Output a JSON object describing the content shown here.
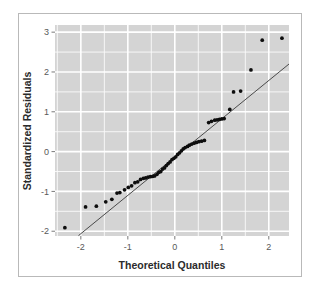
{
  "figure": {
    "kind": "qq-plot",
    "background_color": "#ffffff",
    "border_color": "#b9b9b9",
    "panel_color": "#d4d4d4",
    "gridline_color": "#ffffff",
    "point_color": "#0d0d0d",
    "line_color": "#4a4a4a"
  },
  "chart_data": {
    "type": "scatter",
    "title": "",
    "subtitle": "",
    "xlabel": "Theoretical Quantiles",
    "ylabel": "Standardized Residuals",
    "xlim": [
      -2.55,
      2.43
    ],
    "ylim": [
      -2.12,
      3.18
    ],
    "xticks": [
      -2,
      -1,
      0,
      1,
      2
    ],
    "xticklabels": [
      "-2",
      "-1",
      "0",
      "1",
      "2"
    ],
    "yticks": [
      3,
      2,
      1,
      0,
      -1,
      -2
    ],
    "yticklabels": [
      "3",
      "2",
      "1",
      "0",
      "-1",
      "-2"
    ],
    "grid": true,
    "grid_orientation": "both",
    "legend": null,
    "legend_position": "none",
    "annotations": [],
    "series": [
      {
        "name": "Standardized residuals vs theoretical quantiles",
        "marker": "filled-circle",
        "marker_size": 3.0,
        "points": [
          [
            -2.34,
            -1.91
          ],
          [
            -1.9,
            -1.39
          ],
          [
            -1.67,
            -1.37
          ],
          [
            -1.47,
            -1.26
          ],
          [
            -1.34,
            -1.2
          ],
          [
            -1.23,
            -1.04
          ],
          [
            -1.17,
            -1.03
          ],
          [
            -1.07,
            -0.96
          ],
          [
            -0.99,
            -0.9
          ],
          [
            -0.92,
            -0.86
          ],
          [
            -0.85,
            -0.78
          ],
          [
            -0.79,
            -0.76
          ],
          [
            -0.73,
            -0.7
          ],
          [
            -0.67,
            -0.67
          ],
          [
            -0.62,
            -0.66
          ],
          [
            -0.57,
            -0.64
          ],
          [
            -0.52,
            -0.63
          ],
          [
            -0.47,
            -0.62
          ],
          [
            -0.43,
            -0.61
          ],
          [
            -0.38,
            -0.57
          ],
          [
            -0.34,
            -0.52
          ],
          [
            -0.3,
            -0.5
          ],
          [
            -0.26,
            -0.44
          ],
          [
            -0.22,
            -0.41
          ],
          [
            -0.18,
            -0.35
          ],
          [
            -0.14,
            -0.3
          ],
          [
            -0.1,
            -0.26
          ],
          [
            -0.06,
            -0.2
          ],
          [
            -0.02,
            -0.17
          ],
          [
            0.02,
            -0.13
          ],
          [
            0.06,
            -0.07
          ],
          [
            0.1,
            -0.03
          ],
          [
            0.14,
            0.02
          ],
          [
            0.18,
            0.07
          ],
          [
            0.22,
            0.1
          ],
          [
            0.27,
            0.13
          ],
          [
            0.31,
            0.16
          ],
          [
            0.36,
            0.19
          ],
          [
            0.41,
            0.21
          ],
          [
            0.46,
            0.23
          ],
          [
            0.51,
            0.25
          ],
          [
            0.57,
            0.26
          ],
          [
            0.63,
            0.28
          ],
          [
            0.72,
            0.73
          ],
          [
            0.78,
            0.76
          ],
          [
            0.85,
            0.79
          ],
          [
            0.9,
            0.8
          ],
          [
            0.95,
            0.81
          ],
          [
            1.0,
            0.82
          ],
          [
            1.05,
            0.83
          ],
          [
            1.17,
            1.06
          ],
          [
            1.25,
            1.5
          ],
          [
            1.4,
            1.52
          ],
          [
            1.62,
            2.05
          ],
          [
            1.86,
            2.8
          ],
          [
            2.28,
            2.85
          ]
        ]
      }
    ],
    "reference_line": {
      "name": "qq-reference-line",
      "x_start": -2.05,
      "y_start": -2.11,
      "x_end": 2.43,
      "y_end": 2.2
    }
  }
}
